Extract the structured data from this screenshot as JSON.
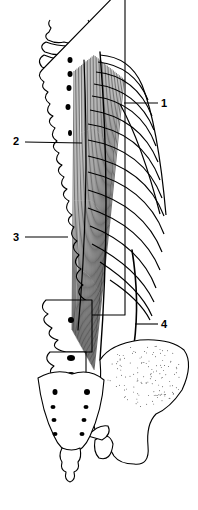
{
  "figure": {
    "colors": {
      "ink": "#000000",
      "background": "#ffffff"
    },
    "labels": [
      {
        "id": "1",
        "text": "1"
      },
      {
        "id": "2",
        "text": "2"
      },
      {
        "id": "3",
        "text": "3"
      },
      {
        "id": "4",
        "text": "4"
      }
    ]
  }
}
